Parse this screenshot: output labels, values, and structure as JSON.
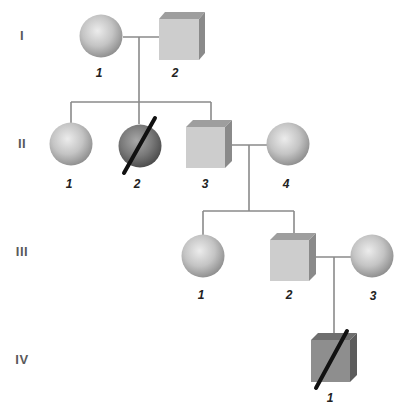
{
  "diagram": {
    "type": "pedigree",
    "generations": [
      {
        "label": "I",
        "y": 36
      },
      {
        "label": "II",
        "y": 144
      },
      {
        "label": "III",
        "y": 252
      },
      {
        "label": "IV",
        "y": 360
      }
    ],
    "individuals": [
      {
        "id": "I-1",
        "generation": "I",
        "number": "1",
        "sex": "female",
        "affected": false,
        "deceased": false
      },
      {
        "id": "I-2",
        "generation": "I",
        "number": "2",
        "sex": "male",
        "affected": false,
        "deceased": false
      },
      {
        "id": "II-1",
        "generation": "II",
        "number": "1",
        "sex": "female",
        "affected": false,
        "deceased": false
      },
      {
        "id": "II-2",
        "generation": "II",
        "number": "2",
        "sex": "female",
        "affected": true,
        "deceased": true
      },
      {
        "id": "II-3",
        "generation": "II",
        "number": "3",
        "sex": "male",
        "affected": false,
        "deceased": false
      },
      {
        "id": "II-4",
        "generation": "II",
        "number": "4",
        "sex": "female",
        "affected": false,
        "deceased": false
      },
      {
        "id": "III-1",
        "generation": "III",
        "number": "1",
        "sex": "female",
        "affected": false,
        "deceased": false
      },
      {
        "id": "III-2",
        "generation": "III",
        "number": "2",
        "sex": "male",
        "affected": false,
        "deceased": false
      },
      {
        "id": "III-3",
        "generation": "III",
        "number": "3",
        "sex": "female",
        "affected": false,
        "deceased": false
      },
      {
        "id": "IV-1",
        "generation": "IV",
        "number": "1",
        "sex": "male",
        "affected": true,
        "deceased": true
      }
    ],
    "matings": [
      {
        "partners": [
          "I-1",
          "I-2"
        ],
        "children": [
          "II-1",
          "II-2",
          "II-3"
        ]
      },
      {
        "partners": [
          "II-3",
          "II-4"
        ],
        "children": [
          "III-1",
          "III-2"
        ]
      },
      {
        "partners": [
          "III-2",
          "III-3"
        ],
        "children": [
          "IV-1"
        ]
      }
    ],
    "colors": {
      "unaffected_fill": "#c8c8c8",
      "affected_fill": "#7a7a7a",
      "line": "#8a8a8a",
      "slash": "#111111",
      "generation_label": "#5a5a5a",
      "individual_label": "#222222"
    }
  }
}
